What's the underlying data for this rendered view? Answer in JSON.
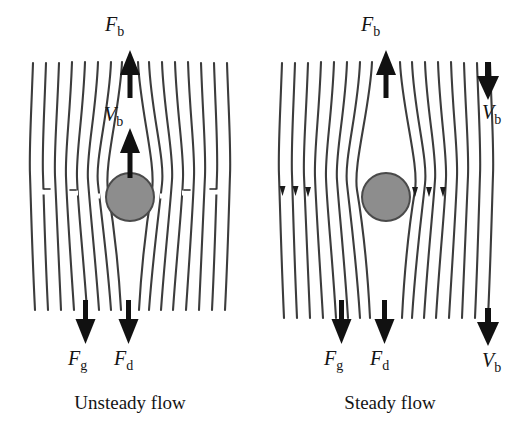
{
  "figure": {
    "type": "fluid-flow-diagram",
    "colors": {
      "streamline": "#3c3c3c",
      "sphere_fill": "#8d8d8d",
      "sphere_stroke": "#4a4a4a",
      "arrow": "#111111",
      "text": "#141414",
      "background": "#ffffff"
    }
  },
  "panels": [
    {
      "id": "unsteady",
      "caption": "Unsteady flow",
      "labels": {
        "buoyancy": {
          "symbol": "F",
          "subscript": "b",
          "direction": "up"
        },
        "velocity": {
          "symbol": "V",
          "subscript": "b",
          "direction": "up"
        },
        "gravity": {
          "symbol": "F",
          "subscript": "g",
          "direction": "down"
        },
        "drag": {
          "symbol": "F",
          "subscript": "d",
          "direction": "down"
        }
      },
      "streamlines": {
        "count_left": 8,
        "count_right": 8,
        "marker": "dash-break",
        "marker_count_per_side": 4
      },
      "sphere": {
        "cx": 130,
        "cy": 197,
        "r": 24
      }
    },
    {
      "id": "steady",
      "caption": "Steady flow",
      "labels": {
        "buoyancy": {
          "symbol": "F",
          "subscript": "b",
          "direction": "up"
        },
        "velocity_top": {
          "symbol": "V",
          "subscript": "b",
          "direction": "down"
        },
        "velocity_bottom": {
          "symbol": "V",
          "subscript": "b",
          "direction": "down"
        },
        "gravity": {
          "symbol": "F",
          "subscript": "g",
          "direction": "down"
        },
        "drag": {
          "symbol": "F",
          "subscript": "d",
          "direction": "down"
        }
      },
      "streamlines": {
        "count_left": 8,
        "count_right": 8,
        "marker": "arrowhead-down",
        "marker_count_per_side": 3
      },
      "sphere": {
        "cx": 126,
        "cy": 197,
        "r": 24
      }
    }
  ]
}
